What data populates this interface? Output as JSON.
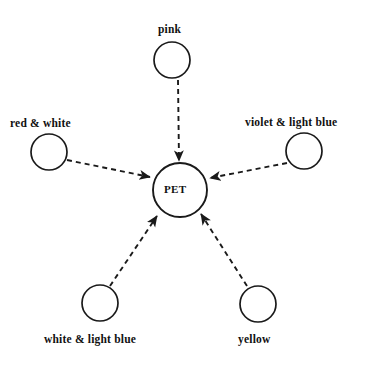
{
  "diagram": {
    "type": "radial-influence-diagram",
    "background_color": "#ffffff",
    "stroke_color": "#1a1a1a",
    "center": {
      "id": "pet",
      "label": "PET",
      "shape": "circle",
      "cx": 180,
      "cy": 190,
      "r": 27
    },
    "nodes": [
      {
        "id": "pink",
        "label": "pink",
        "shape": "circle",
        "cx": 172,
        "cy": 60,
        "r": 18,
        "label_x": 158,
        "label_y": 24,
        "label_position": "above"
      },
      {
        "id": "red-white",
        "label": "red & white",
        "shape": "circle",
        "cx": 49,
        "cy": 152,
        "r": 18,
        "label_x": 10,
        "label_y": 118,
        "label_position": "above"
      },
      {
        "id": "violet-light-blue",
        "label": "violet & light blue",
        "shape": "circle",
        "cx": 304,
        "cy": 151,
        "r": 18,
        "label_x": 245,
        "label_y": 117,
        "label_position": "above"
      },
      {
        "id": "white-light-blue",
        "label": "white & light blue",
        "shape": "circle",
        "cx": 100,
        "cy": 303,
        "r": 18,
        "label_x": 44,
        "label_y": 334,
        "label_position": "below"
      },
      {
        "id": "yellow",
        "label": "yellow",
        "shape": "circle",
        "cx": 258,
        "cy": 304,
        "r": 18,
        "label_x": 238,
        "label_y": 334,
        "label_position": "below"
      }
    ],
    "edges": [
      {
        "id": "edge-pink-pet",
        "from": "pink",
        "to": "pet",
        "style": "dashed",
        "arrow": "to",
        "x1": 178,
        "y1": 80,
        "x2": 179,
        "y2": 161
      },
      {
        "id": "edge-red-white-pet",
        "from": "red-white",
        "to": "pet",
        "style": "dashed",
        "arrow": "to",
        "x1": 67,
        "y1": 160,
        "x2": 150,
        "y2": 177
      },
      {
        "id": "edge-violet-light-blue-pet",
        "from": "violet-light-blue",
        "to": "pet",
        "style": "dashed",
        "arrow": "to",
        "x1": 287,
        "y1": 163,
        "x2": 210,
        "y2": 178
      },
      {
        "id": "edge-white-light-blue-pet",
        "from": "white-light-blue",
        "to": "pet",
        "style": "dashed",
        "arrow": "to",
        "x1": 110,
        "y1": 286,
        "x2": 157,
        "y2": 216
      },
      {
        "id": "edge-yellow-pet",
        "from": "yellow",
        "to": "pet",
        "style": "dashed",
        "arrow": "to",
        "x1": 247,
        "y1": 286,
        "x2": 201,
        "y2": 214
      }
    ]
  }
}
